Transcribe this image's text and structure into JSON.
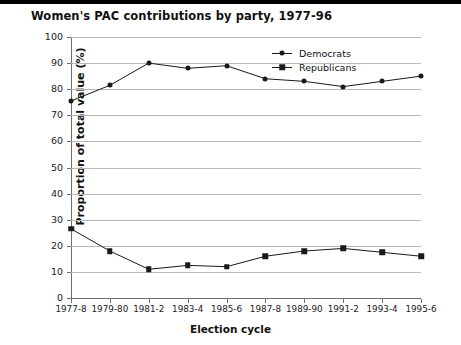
{
  "header": {
    "title": "Women's PAC contributions by party, 1977-96"
  },
  "chart_data": {
    "type": "line",
    "title": "Women's PAC contributions by party, 1977-96",
    "xlabel": "Election cycle",
    "ylabel": "Proportion of total value (%)",
    "categories": [
      "1977-8",
      "1979-80",
      "1981-2",
      "1983-4",
      "1985-6",
      "1987-8",
      "1989-90",
      "1991-2",
      "1993-4",
      "1995-6"
    ],
    "ylim": [
      0,
      100
    ],
    "yticks": [
      0,
      10,
      20,
      30,
      40,
      50,
      60,
      70,
      80,
      90,
      100
    ],
    "grid": "horizontal",
    "legend_position": "top-right",
    "series": [
      {
        "name": "Democrats",
        "marker": "diamond",
        "color": "#1a1a1a",
        "values": [
          75.5,
          81.5,
          90,
          88,
          89,
          84,
          83,
          81,
          83,
          85
        ]
      },
      {
        "name": "Republicans",
        "marker": "square",
        "color": "#1a1a1a",
        "values": [
          26.5,
          18,
          11,
          12.5,
          12,
          16,
          18,
          19,
          17.5,
          16
        ]
      }
    ]
  }
}
